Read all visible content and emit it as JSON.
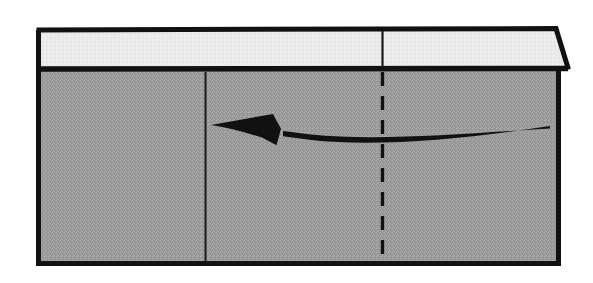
{
  "figure": {
    "canvas": {
      "width": 593,
      "height": 283,
      "background": "#ffffff"
    },
    "colors": {
      "outline": "#111111",
      "lid_fill": "#e9e9e9",
      "body_fill": "#9c9c9c",
      "dither_light": "#f5f5f5",
      "dither_dark": "#8a8a8a",
      "arrow": "#111111",
      "thin_line": "#1a1a1a"
    },
    "outer_box": {
      "name": "box-outline",
      "left": 36,
      "top": 28,
      "right": 560,
      "bottom": 263,
      "stroke_width": 5
    },
    "lid": {
      "name": "box-lid",
      "top_left_x": 38,
      "top_right_x": 556,
      "bottom_right_x": 568,
      "top_y": 30,
      "bottom_y": 69,
      "divider_stroke_width": 5,
      "label": "lid"
    },
    "body": {
      "name": "box-body",
      "top_y": 72,
      "bottom_y": 261,
      "left_x": 39,
      "right_x": 558,
      "label": "body"
    },
    "solid_partition_line": {
      "name": "partition-line",
      "x": 205,
      "y_start": 72,
      "y_end": 261,
      "stroke_width": 2,
      "style": "solid"
    },
    "dashed_center_line": {
      "name": "center-dashed-line",
      "x": 382,
      "y_start": 30,
      "y_end": 263,
      "stroke_width": 3,
      "style": "dashed",
      "dash_pattern": "14 10",
      "lid_segment_style": "solid",
      "lid_segment_y_start": 30,
      "lid_segment_y_end": 70
    },
    "arrow": {
      "name": "curved-arrow",
      "direction": "leftward",
      "tail_x": 550,
      "tail_y": 127,
      "tip_x": 211,
      "tip_y": 125,
      "control_x": 380,
      "control_y": 146,
      "shaft_width_max": 5,
      "head_length": 58,
      "head_half_width": 17,
      "head_style": "swept-back-concave"
    }
  }
}
